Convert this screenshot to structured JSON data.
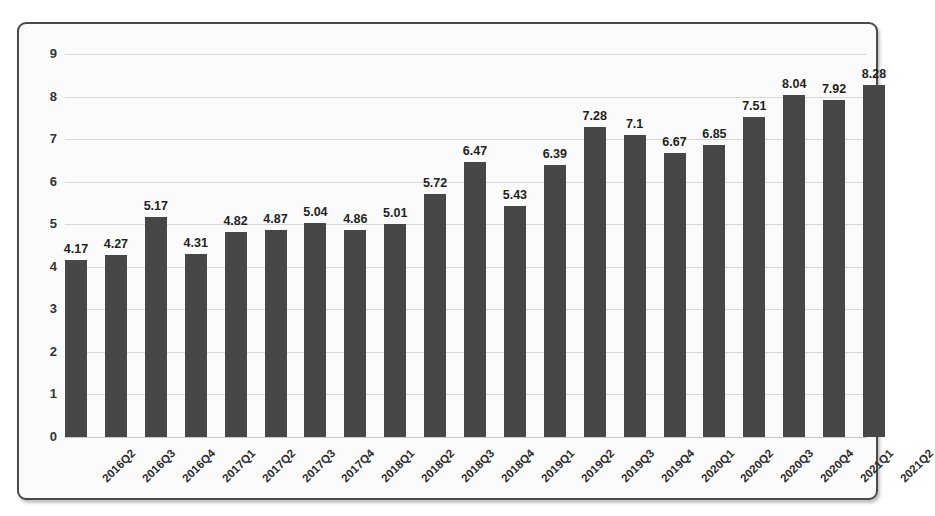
{
  "chart_data": {
    "type": "bar",
    "title": "",
    "subtitle": "",
    "xlabel": "",
    "ylabel": "",
    "categories": [
      "2016Q2",
      "2016Q3",
      "2016Q4",
      "2017Q1",
      "2017Q2",
      "2017Q3",
      "2017Q4",
      "2018Q1",
      "2018Q2",
      "2018Q3",
      "2018Q4",
      "2019Q1",
      "2019Q2",
      "2019Q3",
      "2019Q4",
      "2020Q1",
      "2020Q2",
      "2020Q3",
      "2020Q4",
      "2021Q1",
      "2021Q2"
    ],
    "values": [
      4.17,
      4.27,
      5.17,
      4.31,
      4.82,
      4.87,
      5.04,
      4.86,
      5.01,
      5.72,
      6.47,
      5.43,
      6.39,
      7.28,
      7.1,
      6.67,
      6.85,
      7.51,
      8.04,
      7.92,
      8.28
    ],
    "value_labels": [
      "4.17",
      "4.27",
      "5.17",
      "4.31",
      "4.82",
      "4.87",
      "5.04",
      "4.86",
      "5.01",
      "5.72",
      "6.47",
      "5.43",
      "6.39",
      "7.28",
      "7.1",
      "6.67",
      "6.85",
      "7.51",
      "8.04",
      "7.92",
      "8.28"
    ],
    "ylim": [
      0,
      9
    ],
    "ytick_step": 1,
    "ytick_labels": [
      "0",
      "1",
      "2",
      "3",
      "4",
      "5",
      "6",
      "7",
      "8",
      "9"
    ],
    "grid": true,
    "grid_axis": "y",
    "legend": false,
    "legend_position": "none",
    "bar_color": "#474747",
    "grid_color": "#d8d8d8",
    "background_color": "#fbfbfb",
    "border_color": "#4a4a4a",
    "label_color": "#1f1f1f",
    "xtick_rotation": -45
  }
}
